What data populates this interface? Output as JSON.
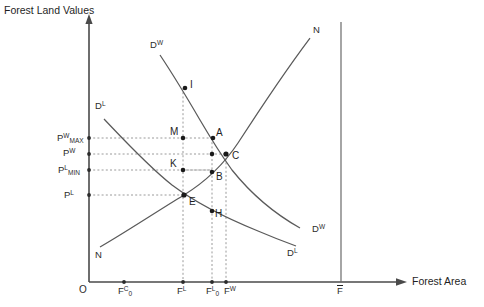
{
  "figure": {
    "y_axis_title": "Forest Land Values",
    "x_axis_title": "Forest Area",
    "origin_label": "O"
  },
  "y_ticks": [
    {
      "id": "pw-max",
      "base": "P",
      "sup": "W",
      "sub": "MAX",
      "y": 138
    },
    {
      "id": "pw",
      "base": "P",
      "sup": "W",
      "sub": "",
      "y": 152
    },
    {
      "id": "pl-min",
      "base": "P",
      "sup": "L",
      "sub": "MIN",
      "y": 170
    },
    {
      "id": "pl",
      "base": "P",
      "sup": "L",
      "sub": "",
      "y": 194
    }
  ],
  "x_ticks": [
    {
      "id": "f0c",
      "base": "F",
      "sup": "C",
      "sub": "0",
      "x": 124
    },
    {
      "id": "fl",
      "base": "F",
      "sup": "L",
      "sub": "",
      "x": 183
    },
    {
      "id": "f0l",
      "base": "F",
      "sup": "L",
      "sub": "0",
      "x": 212
    },
    {
      "id": "fw",
      "base": "F",
      "sup": "W",
      "sub": "",
      "x": 230
    },
    {
      "id": "fbar",
      "base": "F",
      "sup": "",
      "sub": "",
      "x": 341,
      "overbar": true
    }
  ],
  "curves": [
    {
      "id": "demand-wood",
      "label_base": "D",
      "label_sup": "W",
      "label_top": {
        "x": 150,
        "y": 40
      },
      "label_end": {
        "x": 312,
        "y": 224
      }
    },
    {
      "id": "demand-land",
      "label_base": "D",
      "label_sup": "L",
      "label_top": {
        "x": 95,
        "y": 101
      },
      "label_end": {
        "x": 287,
        "y": 248
      }
    },
    {
      "id": "supply-n",
      "label_base": "N",
      "label_sup": "",
      "label_top": {
        "x": 313,
        "y": 25
      },
      "label_end": {
        "x": 95,
        "y": 250
      }
    }
  ],
  "points": [
    {
      "id": "I",
      "label": "I",
      "x": 185,
      "y": 88,
      "lx": 190,
      "ly": 79
    },
    {
      "id": "M",
      "label": "M",
      "x": 183,
      "y": 138,
      "lx": 170,
      "ly": 126
    },
    {
      "id": "A",
      "label": "A",
      "x": 213,
      "y": 138,
      "lx": 216,
      "ly": 127
    },
    {
      "id": "C",
      "label": "C",
      "x": 226,
      "y": 154,
      "lx": 232,
      "ly": 150
    },
    {
      "id": "K",
      "label": "K",
      "x": 183,
      "y": 170,
      "lx": 170,
      "ly": 158
    },
    {
      "id": "B",
      "label": "B",
      "x": 212,
      "y": 172,
      "lx": 216,
      "ly": 171
    },
    {
      "id": "E",
      "label": "E",
      "x": 184,
      "y": 195,
      "lx": 189,
      "ly": 196
    },
    {
      "id": "H",
      "label": "H",
      "x": 212,
      "y": 211,
      "lx": 215,
      "ly": 208
    },
    {
      "id": "W",
      "label": "",
      "x": 212,
      "y": 154,
      "lx": 0,
      "ly": 0
    }
  ],
  "colors": {
    "axis": "#4a4a4a",
    "curve": "#5a5a5a",
    "guide": "#9a9a9a",
    "text": "#1f1f1f",
    "background": "#ffffff"
  }
}
